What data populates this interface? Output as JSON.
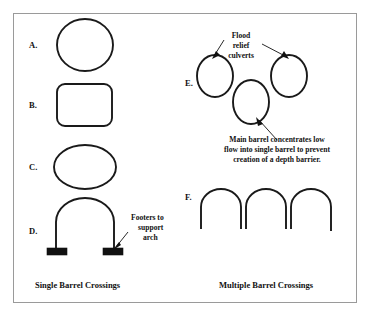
{
  "figure": {
    "panels": [
      {
        "id": "single-barrel",
        "caption": "Single Barrel Crossings",
        "shapes": [
          {
            "label": "A.",
            "kind": "circle-culvert"
          },
          {
            "label": "B.",
            "kind": "box-culvert"
          },
          {
            "label": "C.",
            "kind": "elliptical-culvert"
          },
          {
            "label": "D.",
            "kind": "arch-culvert-with-footers"
          }
        ],
        "annotations": [
          {
            "id": "footers-note",
            "lines": [
              "Footers to",
              "support",
              "arch"
            ]
          }
        ]
      },
      {
        "id": "multiple-barrel",
        "caption": "Multiple Barrel Crossings",
        "shapes": [
          {
            "label": "E.",
            "kind": "three-elliptical-barrels"
          },
          {
            "label": "F.",
            "kind": "three-arch-barrels"
          }
        ],
        "annotations": [
          {
            "id": "flood-relief-note",
            "lines": [
              "Flood",
              "relief",
              "culverts"
            ]
          },
          {
            "id": "main-barrel-note",
            "lines": [
              "Main barrel concentrates low",
              "flow into single barrel to prevent",
              "creation of a depth barrier."
            ]
          }
        ]
      }
    ],
    "colors": {
      "stroke": "#1a1a1a",
      "border": "#9a9a9a",
      "background": "#ffffff",
      "footer_fill": "#111111"
    }
  }
}
